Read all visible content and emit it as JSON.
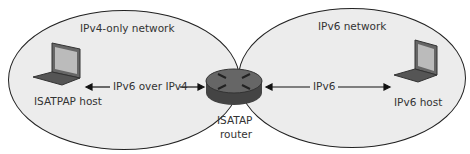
{
  "networks": {
    "left": {
      "label": "IPv4-only network"
    },
    "right": {
      "label": "IPv6 network"
    }
  },
  "nodes": {
    "isatap_host": {
      "label": "ISATPAP host",
      "icon": "laptop-icon"
    },
    "router": {
      "label_line1": "ISATAP",
      "label_line2": "router",
      "icon": "router-icon"
    },
    "ipv6_host": {
      "label": "IPv6 host",
      "icon": "laptop-icon"
    }
  },
  "links": {
    "left": {
      "label": "IPv6 over IPv4"
    },
    "right": {
      "label": "IPv6"
    }
  },
  "colors": {
    "network_fill": "#ececec",
    "outline": "#222222",
    "device": "#555555"
  }
}
